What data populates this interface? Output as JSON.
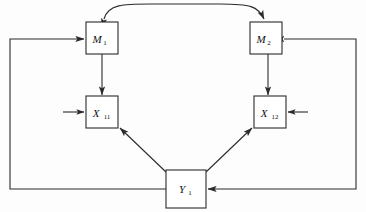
{
  "diagram": {
    "background_color": "#fdfdfd",
    "line_color": "#2b2b2b",
    "nodes": [
      {
        "id": "m1",
        "label": "M",
        "subscript": "1",
        "x": 86,
        "y": 22,
        "width": 32,
        "height": 32
      },
      {
        "id": "m2",
        "label": "M",
        "subscript": "2",
        "x": 250,
        "y": 22,
        "width": 32,
        "height": 32
      },
      {
        "id": "x11",
        "label": "X",
        "subscript": "11",
        "x": 86,
        "y": 96,
        "width": 32,
        "height": 32
      },
      {
        "id": "x12",
        "label": "X",
        "subscript": "12",
        "x": 254,
        "y": 96,
        "width": 32,
        "height": 32
      },
      {
        "id": "y1",
        "label": "Y",
        "subscript": "1",
        "x": 166,
        "y": 170,
        "width": 40,
        "height": 38
      }
    ],
    "edges": [
      {
        "id": "m1-m2-curve",
        "from": "m1",
        "to": "m2",
        "kind": "double-headed-curve",
        "description": "curved bidirectional arrow across the tops of M1 and M2"
      },
      {
        "id": "m1-x11",
        "from": "m1",
        "to": "x11",
        "kind": "vertical-arrow",
        "description": "downward arrow from M1 into X11"
      },
      {
        "id": "m2-x12",
        "from": "m2",
        "to": "x12",
        "kind": "vertical-arrow",
        "description": "downward arrow from M2 into X12"
      },
      {
        "id": "y1-x11",
        "from": "y1",
        "to": "x11",
        "kind": "diagonal-arrow",
        "description": "diagonal arrow from Y1 up-left into X11"
      },
      {
        "id": "y1-x12",
        "from": "y1",
        "to": "x12",
        "kind": "diagonal-arrow",
        "description": "diagonal arrow from Y1 up-right into X12"
      },
      {
        "id": "left-feedback",
        "from": "y1",
        "to": "m1",
        "kind": "routed-feedback",
        "description": "left outer loop from Y1 around the left margin up into M1"
      },
      {
        "id": "right-feedback",
        "from": "y1",
        "to": "m2",
        "kind": "routed-feedback",
        "description": "right outer loop from Y1 around the right margin up into M2"
      },
      {
        "id": "x11-input-stub",
        "from": "external",
        "to": "x11",
        "kind": "stub-arrow",
        "description": "short external input arrow entering X11 from the left"
      },
      {
        "id": "x12-input-stub",
        "from": "external",
        "to": "x12",
        "kind": "stub-arrow",
        "description": "short external input arrow entering X12 from the right"
      }
    ]
  }
}
